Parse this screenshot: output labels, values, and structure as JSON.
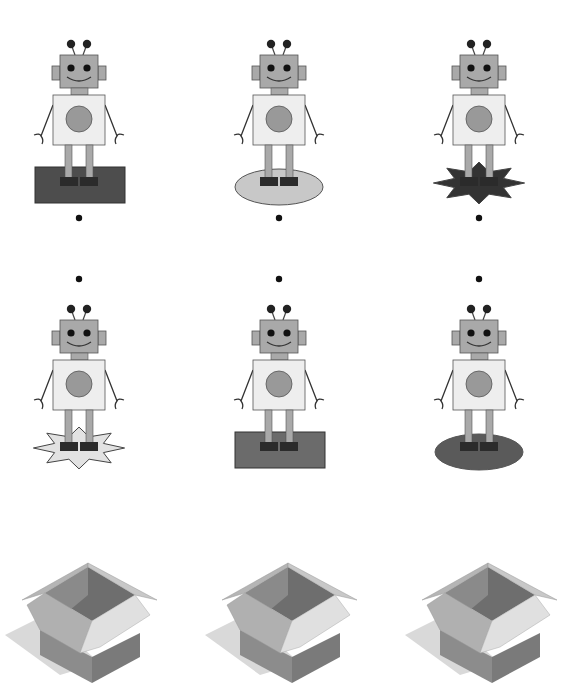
{
  "colors": {
    "robot_gray": "#a9a9a9",
    "robot_body": "#eeeeee",
    "outline": "#555555",
    "foot": "#2b2b2b",
    "dot": "#111111"
  },
  "robots": [
    {
      "id": 1,
      "row": 1,
      "col": 1,
      "platform": "rectangle",
      "platform_color": "#4d4d4d",
      "dot_position": "below"
    },
    {
      "id": 2,
      "row": 1,
      "col": 2,
      "platform": "ellipse",
      "platform_color": "#c8c8c8",
      "dot_position": "below"
    },
    {
      "id": 3,
      "row": 1,
      "col": 3,
      "platform": "star",
      "platform_color": "#333333",
      "dot_position": "below"
    },
    {
      "id": 4,
      "row": 2,
      "col": 1,
      "platform": "star",
      "platform_color": "#e2e2e2",
      "dot_position": "above"
    },
    {
      "id": 5,
      "row": 2,
      "col": 2,
      "platform": "rectangle",
      "platform_color": "#6b6b6b",
      "dot_position": "above"
    },
    {
      "id": 6,
      "row": 2,
      "col": 3,
      "platform": "ellipse",
      "platform_color": "#5a5a5a",
      "dot_position": "above"
    }
  ],
  "boxes": [
    {
      "id": 1,
      "label": "open box"
    },
    {
      "id": 2,
      "label": "open box"
    },
    {
      "id": 3,
      "label": "open box"
    }
  ]
}
